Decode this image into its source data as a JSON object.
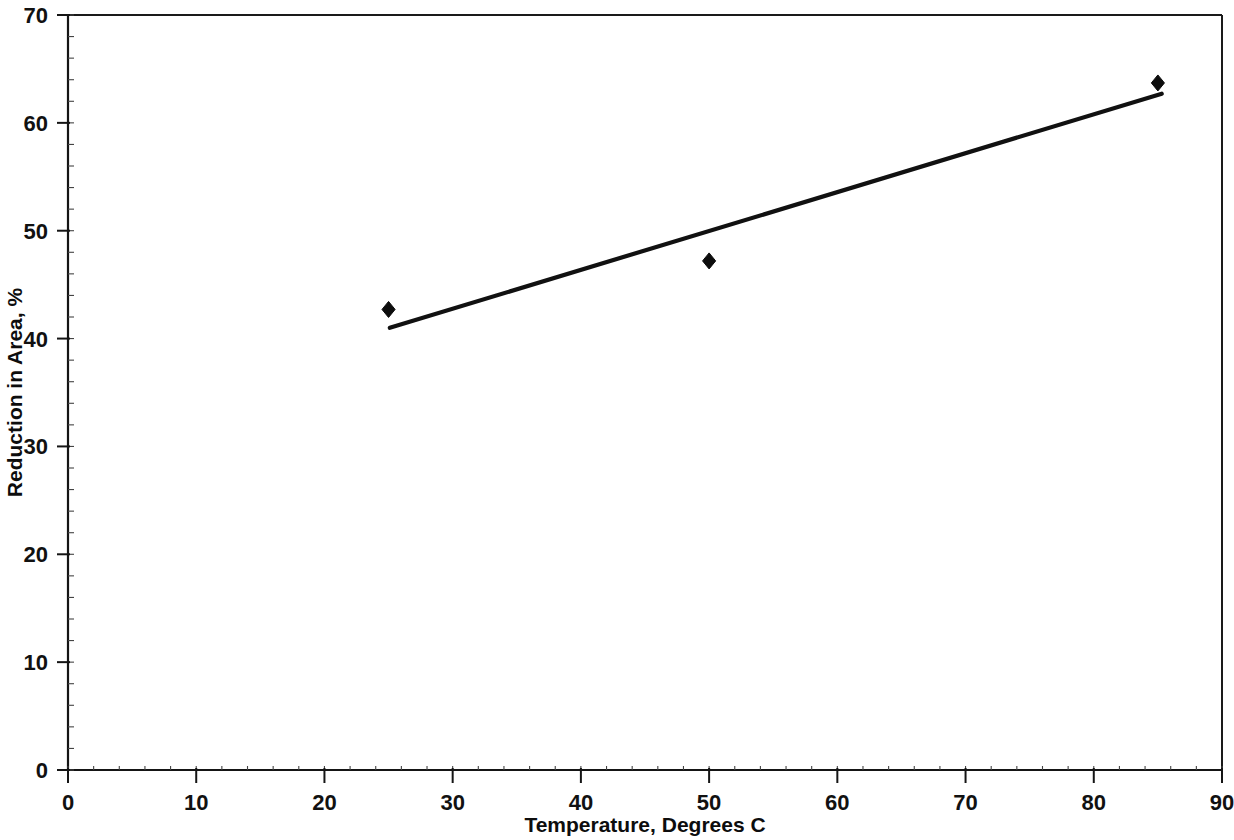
{
  "chart_data": {
    "type": "scatter",
    "title": "",
    "xlabel": "Temperature, Degrees C",
    "ylabel": "Reduction in Area, %",
    "xlim": [
      0,
      90
    ],
    "ylim": [
      0,
      70
    ],
    "xticks": [
      0,
      10,
      20,
      30,
      40,
      50,
      60,
      70,
      80,
      90
    ],
    "yticks": [
      0,
      10,
      20,
      30,
      40,
      50,
      60,
      70
    ],
    "xtick_labels": [
      "0",
      "10",
      "20",
      "30",
      "40",
      "50",
      "60",
      "70",
      "80",
      "90"
    ],
    "ytick_labels": [
      "0",
      "10",
      "20",
      "30",
      "40",
      "50",
      "60",
      "70"
    ],
    "x_minor_tick_step": 2,
    "y_minor_tick_step": 2,
    "grid": false,
    "legend": false,
    "legend_position": "none",
    "frame": "box",
    "marker_shape": "diamond",
    "marker_color": "#0d0d0d",
    "line_color": "#111111",
    "axis_color": "#151515",
    "background_color": "#ffffff",
    "series": [
      {
        "name": "Reduction in Area",
        "type": "scatter",
        "x": [
          25,
          50,
          85
        ],
        "y": [
          42.7,
          47.2,
          63.7
        ]
      },
      {
        "name": "Trend line",
        "type": "line",
        "x": [
          25.1,
          85.3
        ],
        "y": [
          41.0,
          62.7
        ]
      }
    ]
  }
}
